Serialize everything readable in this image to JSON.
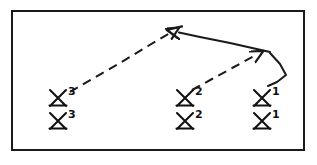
{
  "diagram": {
    "style": "hand-drawn line drawing",
    "stroke_color": "#1a1a1a",
    "background_color": "#ffffff",
    "border": {
      "name": "outer-frame",
      "x": 11,
      "y": 10,
      "width": 294,
      "height": 141,
      "stroke_width": 2
    },
    "units": [
      {
        "id": "unit-3-top",
        "echelon_label": "3",
        "x": 58,
        "y": 98,
        "row": "top"
      },
      {
        "id": "unit-3-bottom",
        "echelon_label": "3",
        "x": 58,
        "y": 121,
        "row": "bottom"
      },
      {
        "id": "unit-2-top",
        "echelon_label": "2",
        "x": 185,
        "y": 98,
        "row": "top"
      },
      {
        "id": "unit-2-bottom",
        "echelon_label": "2",
        "x": 185,
        "y": 121,
        "row": "bottom"
      },
      {
        "id": "unit-1-top",
        "echelon_label": "1",
        "x": 262,
        "y": 98,
        "row": "top"
      },
      {
        "id": "unit-1-bottom",
        "echelon_label": "1",
        "x": 262,
        "y": 121,
        "row": "bottom"
      }
    ],
    "arrows": [
      {
        "id": "arrow-from-3",
        "style": "dashed",
        "from": "unit-3-top",
        "to": "convergence-point",
        "path": "M 70 92 L 170 33",
        "arrowhead": "end"
      },
      {
        "id": "arrow-from-2",
        "style": "dashed",
        "from": "unit-2-top",
        "to": "unit-1-hook",
        "path": "M 192 90 L 255 56",
        "arrowhead": "end"
      },
      {
        "id": "arrow-from-1",
        "style": "solid",
        "from": "unit-1-hook",
        "to": "convergence-point",
        "path": "M 269 52 L 178 32",
        "arrowhead": "end"
      }
    ],
    "connectors": [
      {
        "id": "unit-1-hook",
        "style": "solid",
        "path": "M 269 52 L 286 75 L 268 86",
        "description": "bent hook from unit 1 up to the solid arrow tail"
      }
    ]
  }
}
